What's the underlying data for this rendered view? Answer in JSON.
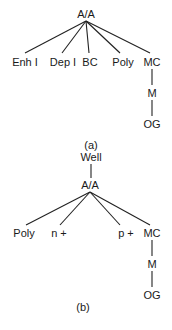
{
  "tree_a": {
    "root": "A/A",
    "children": [
      "Enh I",
      "Dep I",
      "BC",
      "Poly",
      "MC"
    ],
    "chain": [
      "M",
      "OG"
    ],
    "caption": "(a)"
  },
  "tree_b": {
    "top": "Well",
    "root": "A/A",
    "children": [
      "Poly",
      "n +",
      "p +",
      "MC"
    ],
    "chain": [
      "M",
      "OG"
    ],
    "caption": "(b)"
  }
}
